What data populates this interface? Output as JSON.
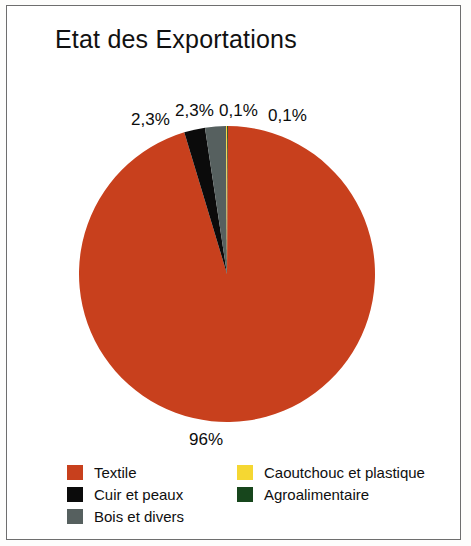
{
  "chart": {
    "title": "Etat des Exportations",
    "frame_border_color": "#6e6e6e",
    "background_color": "#ffffff"
  },
  "chart_data": {
    "type": "pie",
    "title": "Etat des Exportations",
    "xlabel": "",
    "ylabel": "",
    "legend_position": "bottom",
    "grid": false,
    "categories": [
      "Textile",
      "Cuir et peaux",
      "Bois et divers",
      "Caoutchouc et plastique",
      "Agroalimentaire"
    ],
    "values": [
      96,
      2.3,
      2.3,
      0.1,
      0.1
    ],
    "value_labels": [
      "96%",
      "2,3%",
      "2,3%",
      "0,1%",
      "0,1%"
    ],
    "colors": [
      "#C8401D",
      "#0B0B0B",
      "#56605F",
      "#F5D732",
      "#17461C"
    ],
    "slices": [
      {
        "name": "Textile",
        "value": 96,
        "label": "96%",
        "color": "#C8401D"
      },
      {
        "name": "Cuir et peaux",
        "value": 2.3,
        "label": "2,3%",
        "color": "#0B0B0B"
      },
      {
        "name": "Bois et divers",
        "value": 2.3,
        "label": "2,3%",
        "color": "#56605F"
      },
      {
        "name": "Caoutchouc et plastique",
        "value": 0.1,
        "label": "0,1%",
        "color": "#F5D732"
      },
      {
        "name": "Agroalimentaire",
        "value": 0.1,
        "label": "0,1%",
        "color": "#17461C"
      }
    ]
  },
  "legend": {
    "column_1": [
      {
        "label": "Textile",
        "color": "#C8401D",
        "swatch_name": "swatch-textile"
      },
      {
        "label": "Cuir et peaux",
        "color": "#0B0B0B",
        "swatch_name": "swatch-cuir-et-peaux"
      },
      {
        "label": "Bois et divers",
        "color": "#56605F",
        "swatch_name": "swatch-bois-et-divers"
      }
    ],
    "column_2": [
      {
        "label": "Caoutchouc et plastique",
        "color": "#F5D732",
        "swatch_name": "swatch-caoutchouc-et-plastique"
      },
      {
        "label": "Agroalimentaire",
        "color": "#17461C",
        "swatch_name": "swatch-agroalimentaire"
      }
    ]
  }
}
